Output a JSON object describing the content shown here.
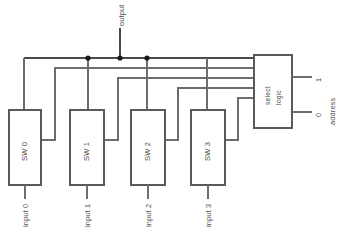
{
  "diagram": {
    "type": "schematic",
    "colors": {
      "wire": "#6d6d6d",
      "box_outline": "#5a5a5a",
      "junction": "#1a1a1a",
      "text": "#4d4d4d",
      "background": "#ffffff"
    },
    "output_label": "output",
    "address_label": "address",
    "select_block": {
      "line1": "select",
      "line2": "logic"
    },
    "address_bits": [
      {
        "label": "1"
      },
      {
        "label": "0"
      }
    ],
    "switches": [
      {
        "label": "SW 0",
        "input_label": "input 0"
      },
      {
        "label": "SW 1",
        "input_label": "input 1"
      },
      {
        "label": "SW 2",
        "input_label": "input 2"
      },
      {
        "label": "SW 3",
        "input_label": "input 3"
      }
    ],
    "junction_count": "3"
  }
}
